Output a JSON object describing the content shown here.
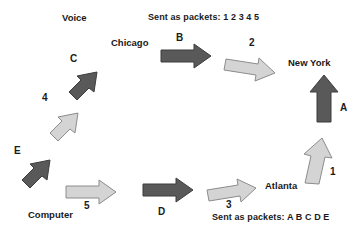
{
  "diagram": {
    "colors": {
      "dark_arrow_fill": "#595959",
      "dark_arrow_stroke": "#3d3d3d",
      "light_arrow_fill": "#d4d4d4",
      "light_arrow_stroke": "#8c8c8c",
      "text": "#1a1a1a",
      "background": "#ffffff"
    },
    "captions": [
      {
        "id": "top-caption",
        "text": "Sent as packets:  1 2 3 4 5"
      },
      {
        "id": "bottom-caption",
        "text": "Sent as packets:  A B C D E"
      }
    ],
    "nodes": [
      {
        "id": "voice",
        "label": "Voice"
      },
      {
        "id": "computer",
        "label": "Computer"
      },
      {
        "id": "chicago",
        "label": "Chicago"
      },
      {
        "id": "new-york",
        "label": "New York"
      },
      {
        "id": "atlanta",
        "label": "Atlanta"
      }
    ],
    "arrows": [
      {
        "id": "arrow-c",
        "label": "C",
        "style": "dark",
        "direction": "up-right",
        "from": "voice-line",
        "to": "chicago"
      },
      {
        "id": "arrow-4",
        "label": "4",
        "style": "light",
        "direction": "up-right",
        "from": "computer-line",
        "to": "chicago"
      },
      {
        "id": "arrow-e",
        "label": "E",
        "style": "dark",
        "direction": "up-right",
        "from": "computer",
        "to": "voice-line"
      },
      {
        "id": "arrow-b",
        "label": "B",
        "style": "dark",
        "direction": "right",
        "from": "chicago",
        "to": "new-york"
      },
      {
        "id": "arrow-2",
        "label": "2",
        "style": "light",
        "direction": "right-down",
        "from": "chicago",
        "to": "new-york"
      },
      {
        "id": "arrow-a",
        "label": "A",
        "style": "dark",
        "direction": "up",
        "from": "atlanta",
        "to": "new-york"
      },
      {
        "id": "arrow-1",
        "label": "1",
        "style": "light",
        "direction": "up",
        "from": "atlanta",
        "to": "new-york"
      },
      {
        "id": "arrow-5",
        "label": "5",
        "style": "light",
        "direction": "right",
        "from": "computer",
        "to": "atlanta"
      },
      {
        "id": "arrow-d",
        "label": "D",
        "style": "dark",
        "direction": "right",
        "from": "computer",
        "to": "atlanta"
      },
      {
        "id": "arrow-3",
        "label": "3",
        "style": "light",
        "direction": "right",
        "from": "computer",
        "to": "atlanta"
      }
    ]
  }
}
